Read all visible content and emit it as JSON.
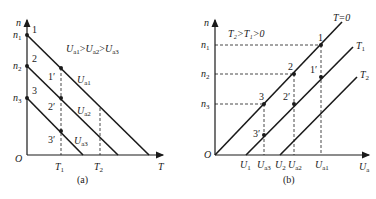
{
  "panel_a": {
    "caption": "(a)",
    "y_axis_label": "n",
    "x_axis_label": "T",
    "origin_label": "O",
    "y_ticks": [
      {
        "name": "n",
        "sub": "1"
      },
      {
        "name": "n",
        "sub": "2"
      },
      {
        "name": "n",
        "sub": "3"
      }
    ],
    "x_ticks": [
      {
        "name": "T",
        "sub": "1"
      },
      {
        "name": "T",
        "sub": "2"
      }
    ],
    "condition": {
      "text": "U",
      "parts": [
        "a1",
        "a2",
        "a3"
      ],
      "relation": ">"
    },
    "lines": [
      {
        "label": "U",
        "sub": "a1",
        "start_point": "1",
        "mid_point": "1′"
      },
      {
        "label": "U",
        "sub": "a2",
        "start_point": "2",
        "mid_point": "2′"
      },
      {
        "label": "U",
        "sub": "a3",
        "start_point": "3",
        "mid_point": "3′"
      }
    ]
  },
  "panel_b": {
    "caption": "(b)",
    "y_axis_label": "n",
    "x_axis_label": "U",
    "x_axis_sub": "a",
    "origin_label": "O",
    "condition": "T₂>T₁>0",
    "y_ticks": [
      {
        "name": "n",
        "sub": "1"
      },
      {
        "name": "n",
        "sub": "2"
      },
      {
        "name": "n",
        "sub": "3"
      }
    ],
    "x_ticks": [
      {
        "name": "U",
        "sub": "1"
      },
      {
        "name": "U",
        "sub": "a3"
      },
      {
        "name": "U",
        "sub": "2"
      },
      {
        "name": "U",
        "sub": "a2"
      },
      {
        "name": "U",
        "sub": "a1"
      }
    ],
    "lines": [
      {
        "label": "T=0",
        "sub": ""
      },
      {
        "label": "T",
        "sub": "1"
      },
      {
        "label": "T",
        "sub": "2"
      }
    ],
    "points": [
      "1",
      "2",
      "3",
      "1′",
      "2′",
      "3′"
    ]
  }
}
